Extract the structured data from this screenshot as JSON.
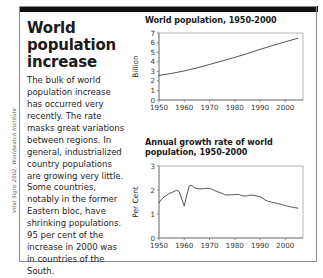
{
  "credit": "Vital Signs 2002, Worldwatch Institute",
  "article": {
    "headline": "World population increase",
    "body": "The bulk of world population increase has occurred very recently. The rate masks great variations between regions. In general, industrialized country populations are growing very little. Some countries, notably in the former Eastern bloc, have shrinking populations. 95 per cent of the increase in 2000 was in countries of the South."
  },
  "colors": {
    "rule": "#111111",
    "frame": "#8d8d8d",
    "line": "#3a3633",
    "text": "#2a2724"
  },
  "chart_data": [
    {
      "id": "world-population",
      "type": "line",
      "title": "World population, 1950-2000",
      "xlabel": "",
      "ylabel": "Billion",
      "xlim": [
        1950,
        2007
      ],
      "ylim": [
        0,
        7
      ],
      "xticks": [
        1950,
        1960,
        1970,
        1980,
        1990,
        2000
      ],
      "xtick_labels": [
        "1950",
        "1960",
        "1970",
        "1980",
        "1990",
        "2000"
      ],
      "yticks": [
        0,
        1,
        2,
        3,
        4,
        5,
        6,
        7
      ],
      "ytick_labels": [
        "0",
        "1",
        "2",
        "3",
        "4",
        "5",
        "6",
        "7"
      ],
      "grid": false,
      "legend": "none",
      "x": [
        1950,
        1955,
        1960,
        1965,
        1970,
        1975,
        1980,
        1985,
        1990,
        1995,
        2000,
        2005
      ],
      "values": [
        2.56,
        2.78,
        3.04,
        3.35,
        3.71,
        4.08,
        4.45,
        4.85,
        5.29,
        5.69,
        6.08,
        6.45
      ]
    },
    {
      "id": "annual-growth-rate",
      "type": "line",
      "title": "Annual growth rate of world population, 1950-2000",
      "xlabel": "",
      "ylabel": "Per Cent",
      "xlim": [
        1950,
        2007
      ],
      "ylim": [
        0,
        3
      ],
      "xticks": [
        1950,
        1960,
        1970,
        1980,
        1990,
        2000
      ],
      "xtick_labels": [
        "1950",
        "1960",
        "1970",
        "1980",
        "1990",
        "2000"
      ],
      "yticks": [
        0,
        1,
        2,
        3
      ],
      "ytick_labels": [
        "0",
        "1",
        "2",
        "3"
      ],
      "grid": false,
      "legend": "none",
      "x": [
        1950,
        1951,
        1952,
        1953,
        1954,
        1955,
        1956,
        1957,
        1958,
        1959,
        1960,
        1961,
        1962,
        1963,
        1964,
        1965,
        1966,
        1967,
        1968,
        1969,
        1970,
        1971,
        1972,
        1973,
        1974,
        1975,
        1976,
        1977,
        1978,
        1979,
        1980,
        1981,
        1982,
        1983,
        1984,
        1985,
        1986,
        1987,
        1988,
        1989,
        1990,
        1991,
        1992,
        1993,
        1994,
        1995,
        1996,
        1997,
        1998,
        1999,
        2000,
        2001,
        2002,
        2003,
        2004,
        2005
      ],
      "values": [
        1.47,
        1.61,
        1.71,
        1.77,
        1.86,
        1.89,
        1.94,
        1.99,
        1.93,
        1.62,
        1.33,
        1.79,
        2.17,
        2.2,
        2.09,
        2.06,
        2.05,
        2.05,
        2.06,
        2.07,
        2.07,
        2.03,
        1.98,
        1.93,
        1.9,
        1.86,
        1.8,
        1.79,
        1.8,
        1.8,
        1.81,
        1.82,
        1.8,
        1.76,
        1.75,
        1.76,
        1.79,
        1.78,
        1.77,
        1.74,
        1.72,
        1.66,
        1.58,
        1.54,
        1.51,
        1.48,
        1.46,
        1.44,
        1.41,
        1.38,
        1.35,
        1.32,
        1.3,
        1.28,
        1.26,
        1.24
      ]
    }
  ]
}
